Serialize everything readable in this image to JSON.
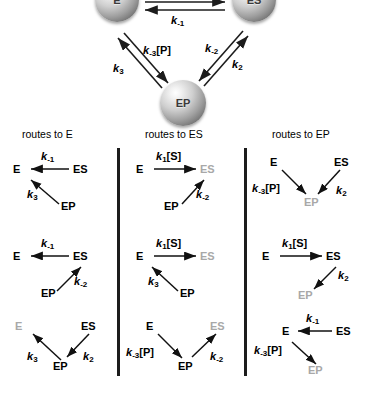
{
  "figure": {
    "cycle": {
      "nodes": [
        {
          "id": "E",
          "label": "E"
        },
        {
          "id": "ES",
          "label": "ES"
        },
        {
          "id": "EP",
          "label": "EP"
        }
      ],
      "rate_labels": {
        "k_minus_1": "k",
        "k_minus_1_sub": "-1",
        "k_minus_3P": "k",
        "k_minus_3P_sub": "-3",
        "k_minus_3P_br": "[P]",
        "k_3": "k",
        "k_3_sub": "3",
        "k_minus_2": "k",
        "k_minus_2_sub": "-2",
        "k_2": "k",
        "k_2_sub": "2"
      }
    },
    "columns": [
      {
        "id": "col-E",
        "header": "routes to E"
      },
      {
        "id": "col-ES",
        "header": "routes to ES"
      },
      {
        "id": "col-EP",
        "header": "routes to EP"
      }
    ],
    "panels": {
      "c1r1": {
        "nodes": {
          "E": "E",
          "ES": "ES",
          "EP": "EP"
        },
        "k_top": "k",
        "k_top_sub": "-1",
        "k_diag": "k",
        "k_diag_sub": "3"
      },
      "c1r2": {
        "nodes": {
          "E": "E",
          "ES": "ES",
          "EP": "EP"
        },
        "k_top": "k",
        "k_top_sub": "-1",
        "k_diag": "k",
        "k_diag_sub": "-2"
      },
      "c1r3": {
        "nodes": {
          "E": "E",
          "ES": "ES",
          "EP": "EP"
        },
        "k_left": "k",
        "k_left_sub": "3",
        "k_right": "k",
        "k_right_sub": "2"
      },
      "c2r1": {
        "nodes": {
          "E": "E",
          "ES": "ES",
          "EP": "EP"
        },
        "k_top": "k",
        "k_top_sub": "1",
        "k_top_br": "[S]",
        "k_diag": "k",
        "k_diag_sub": "-2"
      },
      "c2r2": {
        "nodes": {
          "E": "E",
          "ES": "ES",
          "EP": "EP"
        },
        "k_top": "k",
        "k_top_sub": "1",
        "k_top_br": "[S]",
        "k_diag": "k",
        "k_diag_sub": "3"
      },
      "c2r3": {
        "nodes": {
          "E": "E",
          "ES": "ES",
          "EP": "EP"
        },
        "k_left": "k",
        "k_left_sub": "-3",
        "k_left_br": "[P]",
        "k_right": "k",
        "k_right_sub": "-2"
      },
      "c3r1": {
        "nodes": {
          "E": "E",
          "ES": "ES",
          "EP": "EP"
        },
        "k_left": "k",
        "k_left_sub": "-3",
        "k_left_br": "[P]",
        "k_right": "k",
        "k_right_sub": "2"
      },
      "c3r2": {
        "nodes": {
          "E": "E",
          "ES": "ES",
          "EP": "EP"
        },
        "k_top": "k",
        "k_top_sub": "1",
        "k_top_br": "[S]",
        "k_diag": "k",
        "k_diag_sub": "2"
      },
      "c3r3": {
        "nodes": {
          "E": "E",
          "ES": "ES",
          "EP": "EP"
        },
        "k_top": "k",
        "k_top_sub": "-1",
        "k_diag": "k",
        "k_diag_sub": "-3",
        "k_diag_br": "[P]"
      }
    },
    "colors": {
      "ink": "#000000",
      "dim_node": "#a8a8a8",
      "divider": "#1c1c1c",
      "sphere_light": "#f2f2f2",
      "sphere_dark": "#4a4a4a"
    }
  }
}
